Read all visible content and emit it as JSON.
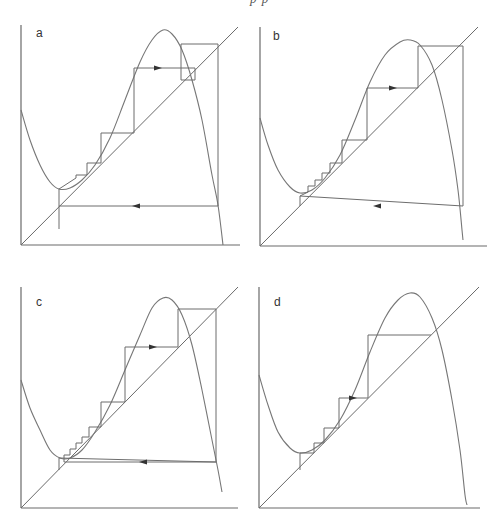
{
  "header": {
    "clipped_text": "p          p"
  },
  "chart_data": [
    {
      "type": "line",
      "title": "a",
      "description": "Cobweb diagram: cubic map curve, identity diagonal, orbit with staircase converging to lower region then jump",
      "origin": [
        21,
        245
      ],
      "x_end": 240,
      "y_top": 25,
      "diag_end": [
        238,
        27
      ],
      "curve": [
        [
          21,
          110
        ],
        [
          30,
          140
        ],
        [
          40,
          165
        ],
        [
          50,
          182
        ],
        [
          59,
          189
        ],
        [
          70,
          188
        ],
        [
          82,
          180
        ],
        [
          95,
          165
        ],
        [
          110,
          138
        ],
        [
          125,
          100
        ],
        [
          140,
          62
        ],
        [
          152,
          40
        ],
        [
          163,
          30
        ],
        [
          172,
          34
        ],
        [
          182,
          50
        ],
        [
          192,
          80
        ],
        [
          202,
          120
        ],
        [
          212,
          175
        ],
        [
          218,
          205
        ],
        [
          223,
          245
        ]
      ],
      "cobweb": [
        [
          59,
          229
        ],
        [
          59,
          206
        ],
        [
          218,
          206
        ],
        [
          218,
          44
        ],
        [
          181,
          44
        ],
        [
          181,
          80
        ],
        [
          195,
          80
        ],
        [
          195,
          68
        ],
        [
          134,
          68
        ],
        [
          134,
          133
        ],
        [
          101,
          133
        ],
        [
          101,
          163
        ],
        [
          87,
          163
        ],
        [
          87,
          175
        ],
        [
          76,
          175
        ],
        [
          76,
          178
        ],
        [
          59,
          189
        ],
        [
          59,
          206
        ]
      ],
      "arrows": [
        {
          "x": 158,
          "y": 68,
          "dir": "right"
        },
        {
          "x": 136,
          "y": 206,
          "dir": "left"
        }
      ],
      "label": "a",
      "label_pos": [
        36,
        37
      ]
    },
    {
      "type": "line",
      "title": "b",
      "origin": [
        260,
        246
      ],
      "x_end": 487,
      "y_top": 27,
      "diag_end": [
        478,
        27
      ],
      "curve": [
        [
          260,
          118
        ],
        [
          268,
          145
        ],
        [
          278,
          170
        ],
        [
          290,
          187
        ],
        [
          300,
          193
        ],
        [
          312,
          190
        ],
        [
          325,
          178
        ],
        [
          340,
          155
        ],
        [
          355,
          120
        ],
        [
          370,
          82
        ],
        [
          385,
          55
        ],
        [
          400,
          42
        ],
        [
          410,
          40
        ],
        [
          420,
          45
        ],
        [
          432,
          65
        ],
        [
          442,
          100
        ],
        [
          452,
          150
        ],
        [
          458,
          190
        ],
        [
          462,
          230
        ],
        [
          463,
          240
        ]
      ],
      "cobweb": [
        [
          300,
          206
        ],
        [
          300,
          196
        ],
        [
          463,
          206
        ],
        [
          463,
          46
        ],
        [
          418,
          46
        ],
        [
          418,
          88
        ],
        [
          367,
          88
        ],
        [
          367,
          140
        ],
        [
          342,
          140
        ],
        [
          342,
          163
        ],
        [
          330,
          163
        ],
        [
          330,
          173
        ],
        [
          322,
          173
        ],
        [
          322,
          180
        ],
        [
          315,
          180
        ],
        [
          315,
          186
        ],
        [
          308,
          186
        ],
        [
          308,
          192
        ],
        [
          300,
          196
        ]
      ],
      "arrows": [
        {
          "x": 393,
          "y": 88,
          "dir": "right"
        },
        {
          "x": 377,
          "y": 206,
          "dir": "left"
        }
      ],
      "label": "b",
      "label_pos": [
        273,
        40
      ]
    },
    {
      "type": "line",
      "title": "c",
      "origin": [
        21,
        508
      ],
      "x_end": 238,
      "y_top": 287,
      "diag_end": [
        238,
        287
      ],
      "curve": [
        [
          21,
          380
        ],
        [
          30,
          408
        ],
        [
          40,
          430
        ],
        [
          50,
          450
        ],
        [
          60,
          458
        ],
        [
          70,
          458
        ],
        [
          82,
          450
        ],
        [
          95,
          432
        ],
        [
          110,
          405
        ],
        [
          125,
          370
        ],
        [
          140,
          335
        ],
        [
          152,
          308
        ],
        [
          163,
          298
        ],
        [
          172,
          300
        ],
        [
          182,
          315
        ],
        [
          192,
          345
        ],
        [
          202,
          390
        ],
        [
          212,
          440
        ],
        [
          218,
          470
        ],
        [
          222,
          492
        ]
      ],
      "cobweb": [
        [
          59,
          470
        ],
        [
          59,
          458
        ],
        [
          216,
          462
        ],
        [
          216,
          309
        ],
        [
          178,
          309
        ],
        [
          178,
          347
        ],
        [
          125,
          347
        ],
        [
          125,
          402
        ],
        [
          101,
          402
        ],
        [
          101,
          427
        ],
        [
          89,
          427
        ],
        [
          89,
          437
        ],
        [
          82,
          437
        ],
        [
          82,
          443
        ],
        [
          76,
          443
        ],
        [
          76,
          449
        ],
        [
          70,
          449
        ],
        [
          70,
          455
        ],
        [
          64,
          455
        ],
        [
          64,
          462
        ],
        [
          216,
          462
        ]
      ],
      "arrows": [
        {
          "x": 153,
          "y": 347,
          "dir": "right"
        },
        {
          "x": 143,
          "y": 462,
          "dir": "left"
        }
      ],
      "label": "c",
      "label_pos": [
        36,
        306
      ]
    },
    {
      "type": "line",
      "title": "d",
      "origin": [
        259,
        508
      ],
      "x_end": 480,
      "y_top": 287,
      "diag_end": [
        479,
        287
      ],
      "curve": [
        [
          259,
          375
        ],
        [
          268,
          405
        ],
        [
          278,
          432
        ],
        [
          290,
          448
        ],
        [
          300,
          453
        ],
        [
          312,
          450
        ],
        [
          325,
          440
        ],
        [
          340,
          420
        ],
        [
          355,
          390
        ],
        [
          370,
          352
        ],
        [
          385,
          318
        ],
        [
          398,
          300
        ],
        [
          410,
          293
        ],
        [
          420,
          297
        ],
        [
          432,
          318
        ],
        [
          442,
          350
        ],
        [
          452,
          400
        ],
        [
          460,
          450
        ],
        [
          465,
          495
        ],
        [
          467,
          505
        ]
      ],
      "cobweb": [
        [
          300,
          470
        ],
        [
          300,
          453
        ],
        [
          314,
          453
        ],
        [
          314,
          443
        ],
        [
          324,
          443
        ],
        [
          324,
          428
        ],
        [
          339,
          428
        ],
        [
          339,
          398
        ],
        [
          368,
          398
        ],
        [
          368,
          335
        ],
        [
          431,
          335
        ]
      ],
      "arrows": [
        {
          "x": 353,
          "y": 398,
          "dir": "right"
        }
      ],
      "label": "d",
      "label_pos": [
        274,
        306
      ]
    }
  ]
}
